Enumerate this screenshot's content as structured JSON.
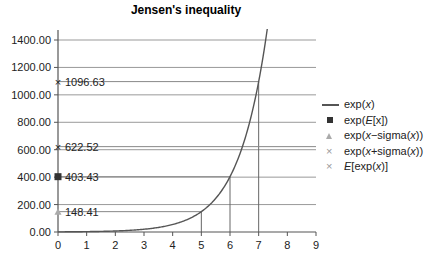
{
  "chart_data": {
    "type": "line",
    "title": "Jensen's inequality",
    "xlabel": "",
    "ylabel": "",
    "xlim": [
      0,
      9
    ],
    "ylim": [
      0,
      1400
    ],
    "x_ticks": [
      "0",
      "1",
      "2",
      "3",
      "4",
      "5",
      "6",
      "7",
      "8",
      "9"
    ],
    "y_ticks": [
      "0.00",
      "200.00",
      "400.00",
      "600.00",
      "800.00",
      "1000.00",
      "1200.00",
      "1400.00"
    ],
    "grid": "horizontal",
    "legend_position": "right",
    "series": [
      {
        "name": "exp(x)",
        "kind": "line",
        "function": "exp(x)",
        "x_range": [
          0,
          7.3
        ]
      },
      {
        "name": "exp(E[x])",
        "kind": "marker-square",
        "x": 0,
        "y": 403.43,
        "label": "403.43"
      },
      {
        "name": "exp(x−sigma(x))",
        "kind": "marker-triangle",
        "x": 0,
        "y": 148.41,
        "label": "148.41"
      },
      {
        "name": "exp(x+sigma(x))",
        "kind": "marker-x",
        "x": 0,
        "y": 1096.63,
        "label": "1096.63"
      },
      {
        "name": "E[exp(x)]",
        "kind": "marker-asterisk",
        "x": 0,
        "y": 622.52,
        "label": "622.52"
      }
    ],
    "reference_lines": [
      {
        "x": 5,
        "y": 148.41
      },
      {
        "x": 6,
        "y": 403.43
      },
      {
        "x": 7,
        "y": 1096.63
      },
      {
        "y": 622.52
      }
    ]
  },
  "legend": [
    {
      "symbol": "line",
      "pre": "exp(",
      "em": "x",
      "post": ")"
    },
    {
      "symbol": "square",
      "pre": "exp(",
      "em": "E",
      "post": "[x])"
    },
    {
      "symbol": "triangle",
      "pre": "exp(",
      "em": "x",
      "post": "−sigma(x))"
    },
    {
      "symbol": "x",
      "pre": "exp(",
      "em": "x",
      "post": "+sigma(x))"
    },
    {
      "symbol": "asterisk",
      "pre": "",
      "em": "E",
      "post": "[exp(x)]"
    }
  ]
}
